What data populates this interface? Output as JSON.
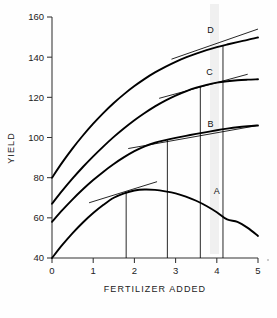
{
  "chart_data": {
    "type": "line",
    "title": "",
    "xlabel": "FERTILIZER ADDED",
    "ylabel": "YIELD",
    "xlim": [
      0,
      5
    ],
    "ylim": [
      40,
      160
    ],
    "xticks": [
      0,
      1,
      2,
      3,
      4,
      5
    ],
    "xtick_labels": [
      "0",
      "1",
      "2",
      "3",
      "4",
      "5"
    ],
    "yticks": [
      40,
      60,
      80,
      100,
      120,
      140,
      160
    ],
    "ytick_labels": [
      "40",
      "60",
      "80",
      "100",
      "120",
      "140",
      "160"
    ],
    "grid": false,
    "legend": "inline-curve-labels",
    "series": [
      {
        "name": "A",
        "label": "A",
        "label_x": 4.0,
        "label_y": 72,
        "x": [
          0,
          0.25,
          0.5,
          0.75,
          1.0,
          1.25,
          1.5,
          1.75,
          2.0,
          2.25,
          2.5,
          2.75,
          3.0,
          3.25,
          3.5,
          3.75,
          4.0,
          4.25,
          4.5,
          4.75,
          5.0
        ],
        "y": [
          40.0,
          46.5,
          52.4,
          57.7,
          62.4,
          66.5,
          70.0,
          72.2,
          73.6,
          74.1,
          73.9,
          73.2,
          72.2,
          70.6,
          68.5,
          65.9,
          62.8,
          59.2,
          58.0,
          55.0,
          51.0
        ],
        "optimum_x": 1.8,
        "optimum_y": 73.0,
        "tangent": {
          "x1": 0.9,
          "y1": 67.5,
          "x2": 2.55,
          "y2": 78.0
        }
      },
      {
        "name": "B",
        "label": "B",
        "label_x": 3.85,
        "label_y": 105,
        "x": [
          0,
          0.25,
          0.5,
          0.75,
          1.0,
          1.25,
          1.5,
          1.75,
          2.0,
          2.25,
          2.5,
          2.75,
          3.0,
          3.25,
          3.5,
          3.75,
          4.0,
          4.25,
          4.5,
          4.75,
          5.0
        ],
        "y": [
          58.0,
          63.8,
          69.2,
          74.2,
          78.8,
          83.0,
          86.8,
          90.2,
          93.2,
          95.6,
          97.4,
          98.7,
          99.8,
          100.8,
          101.8,
          102.7,
          103.6,
          104.4,
          105.1,
          105.6,
          106.0
        ],
        "optimum_x": 2.8,
        "optimum_y": 99.2,
        "tangent": {
          "x1": 1.85,
          "y1": 94.5,
          "x2": 5.0,
          "y2": 106.0
        }
      },
      {
        "name": "C",
        "label": "C",
        "label_x": 3.82,
        "label_y": 131,
        "x": [
          0,
          0.25,
          0.5,
          0.75,
          1.0,
          1.25,
          1.5,
          1.75,
          2.0,
          2.25,
          2.5,
          2.75,
          3.0,
          3.25,
          3.5,
          3.75,
          4.0,
          4.25,
          4.5,
          4.75,
          5.0
        ],
        "y": [
          67.0,
          73.5,
          79.6,
          85.3,
          90.6,
          95.6,
          100.3,
          104.6,
          108.6,
          112.2,
          115.5,
          118.4,
          120.9,
          123.0,
          124.8,
          126.2,
          127.3,
          128.0,
          128.5,
          128.8,
          129.0
        ],
        "optimum_x": 3.6,
        "optimum_y": 125.3,
        "tangent": {
          "x1": 2.6,
          "y1": 119.5,
          "x2": 4.75,
          "y2": 131.5
        }
      },
      {
        "name": "D",
        "label": "D",
        "label_x": 3.85,
        "label_y": 152,
        "x": [
          0,
          0.25,
          0.5,
          0.75,
          1.0,
          1.25,
          1.5,
          1.75,
          2.0,
          2.25,
          2.5,
          2.75,
          3.0,
          3.25,
          3.5,
          3.75,
          4.0,
          4.25,
          4.5,
          4.75,
          5.0
        ],
        "y": [
          80.0,
          87.6,
          94.6,
          101.0,
          106.9,
          112.3,
          117.2,
          121.6,
          125.6,
          129.2,
          132.4,
          135.2,
          137.7,
          139.9,
          141.8,
          143.5,
          145.0,
          146.3,
          147.5,
          148.6,
          149.8
        ],
        "optimum_x": 4.15,
        "optimum_y": 146.0,
        "tangent": {
          "x1": 2.9,
          "y1": 139.0,
          "x2": 5.0,
          "y2": 154.0
        }
      }
    ]
  },
  "axes": {
    "y_title": "YIELD",
    "x_title": "FERTILIZER ADDED"
  }
}
